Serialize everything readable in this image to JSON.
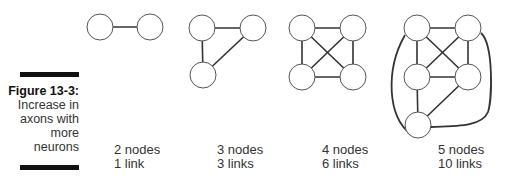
{
  "figure": {
    "label": "Figure 13-3:",
    "caption_lines": [
      "Increase in",
      "axons with",
      "more",
      "neurons"
    ]
  },
  "graphs": [
    {
      "nodes_text": "2 nodes",
      "links_text": "1 link",
      "label_pos": [
        114,
        143
      ],
      "nodes": [
        [
          100,
          27
        ],
        [
          150,
          27
        ]
      ],
      "edges": [
        [
          0,
          1
        ]
      ]
    },
    {
      "nodes_text": "3 nodes",
      "links_text": "3 links",
      "label_pos": [
        217,
        143
      ],
      "nodes": [
        [
          202,
          28
        ],
        [
          253,
          28
        ],
        [
          203,
          75
        ]
      ],
      "edges": [
        [
          0,
          1
        ],
        [
          0,
          2
        ],
        [
          1,
          2
        ]
      ]
    },
    {
      "nodes_text": "4 nodes",
      "links_text": "6 links",
      "label_pos": [
        322,
        143
      ],
      "nodes": [
        [
          302,
          28
        ],
        [
          353,
          28
        ],
        [
          302,
          77
        ],
        [
          353,
          77
        ]
      ],
      "edges": [
        [
          0,
          1
        ],
        [
          2,
          3
        ],
        [
          0,
          2
        ],
        [
          1,
          3
        ],
        [
          0,
          3
        ],
        [
          1,
          2
        ]
      ]
    },
    {
      "nodes_text": "5 nodes",
      "links_text": "10 links",
      "label_pos": [
        438,
        143
      ],
      "nodes": [
        [
          417,
          28
        ],
        [
          468,
          28
        ],
        [
          417,
          77
        ],
        [
          468,
          77
        ],
        [
          418,
          125
        ]
      ],
      "edges": [
        [
          0,
          1
        ],
        [
          2,
          3
        ],
        [
          0,
          2
        ],
        [
          1,
          3
        ],
        [
          0,
          3
        ],
        [
          1,
          2
        ],
        [
          2,
          4
        ],
        [
          3,
          4
        ]
      ],
      "curved_edges": [
        "M405,35 C385,70 388,118 410,133",
        "M481,33 C494,45 492,100 488,112 C482,126 460,126 431,127"
      ]
    }
  ],
  "style": {
    "node_radius": 13,
    "stroke": "#555",
    "edge": "#333"
  }
}
